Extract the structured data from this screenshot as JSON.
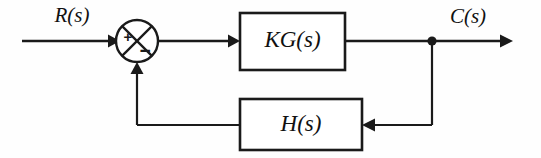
{
  "diagram": {
    "type": "block-diagram",
    "background_color": "#fefefe",
    "line_color": "#1a1a1a",
    "signals": {
      "input_label": "R(s)",
      "output_label": "C(s)"
    },
    "blocks": [
      {
        "id": "forward",
        "label": "KG(s)",
        "role": "forward-path-gain"
      },
      {
        "id": "feedback",
        "label": "H(s)",
        "role": "feedback-path-gain"
      }
    ],
    "summing_junction": {
      "name": "summing-junction",
      "shape": "circle-with-cross",
      "input_sign_primary": "+",
      "input_sign_feedback": "−"
    },
    "nodes": [
      {
        "id": "takeoff",
        "label": "",
        "role": "output-takeoff-point"
      }
    ]
  }
}
